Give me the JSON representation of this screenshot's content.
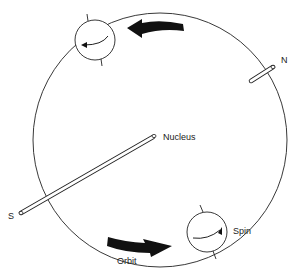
{
  "diagram": {
    "type": "electron orbit and spin illustration",
    "labels": {
      "nucleus": "Nucleus",
      "north": "N",
      "south": "S",
      "spin": "Spin",
      "orbit": "Orbit"
    },
    "elements": [
      {
        "name": "orbit-circle",
        "description": "large circular electron orbit"
      },
      {
        "name": "axis-rod",
        "description": "long thin rod passing through the orbit from S (lower left) to N (upper right)"
      },
      {
        "name": "electron-top",
        "description": "small circle with curved spin arrow on the upper orbit"
      },
      {
        "name": "electron-bottom",
        "description": "small circle with curved spin arrow on the lower orbit, labeled Spin"
      },
      {
        "name": "orbit-arrow-top",
        "description": "thick black arrow pointing left along the top of the orbit"
      },
      {
        "name": "orbit-arrow-bottom",
        "description": "thick black arrow pointing right along the bottom of the orbit, labeled Orbit"
      }
    ],
    "colors": {
      "line": "#222222",
      "fill": "#111111",
      "background": "#ffffff"
    }
  }
}
